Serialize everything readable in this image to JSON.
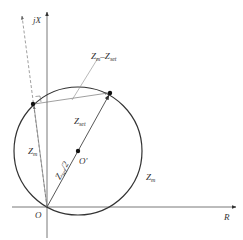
{
  "diagram": {
    "axes": {
      "x_label": "R",
      "y_label": "jX",
      "origin_label": "O"
    },
    "circle": {
      "center_label": "O'",
      "boundary_label": "Z",
      "boundary_label_sub": "m"
    },
    "vectors": {
      "z_set": {
        "main": "Z",
        "sub": "set"
      },
      "z_set_half": {
        "main": "Z",
        "sub": "set",
        "suffix": "/2"
      },
      "z_m": {
        "main": "Z",
        "sub": "m"
      },
      "z_diff": {
        "main1": "Z",
        "sub1": "m",
        "dash": "–",
        "main2": "Z",
        "sub2": "set"
      }
    },
    "colors": {
      "stroke": "#333333",
      "light_stroke": "#777777",
      "background": "#ffffff"
    }
  }
}
